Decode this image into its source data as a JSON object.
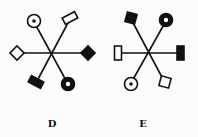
{
  "diagrams": [
    {
      "label": "D",
      "center": [
        52,
        53
      ],
      "arms": [
        {
          "direction": "upper-left",
          "end": [
            34,
            22
          ],
          "symbol": "circle-with-dot"
        },
        {
          "direction": "upper-right",
          "end": [
            69,
            21
          ],
          "symbol": "open-rectangle"
        },
        {
          "direction": "left",
          "end": [
            17,
            53
          ],
          "symbol": "open-diamond"
        },
        {
          "direction": "right",
          "end": [
            88,
            53
          ],
          "symbol": "filled-diamond"
        },
        {
          "direction": "lower-left",
          "end": [
            37,
            81
          ],
          "symbol": "filled-rectangle"
        },
        {
          "direction": "lower-right",
          "end": [
            68,
            84
          ],
          "symbol": "thick-ring"
        }
      ]
    },
    {
      "label": "E",
      "center": [
        148,
        52
      ],
      "arms": [
        {
          "direction": "upper-left",
          "end": [
            131,
            19
          ],
          "symbol": "filled-square"
        },
        {
          "direction": "upper-right",
          "end": [
            166,
            21
          ],
          "symbol": "thick-ring"
        },
        {
          "direction": "left",
          "end": [
            118,
            53
          ],
          "symbol": "open-rectangle-vertical"
        },
        {
          "direction": "right",
          "end": [
            180,
            53
          ],
          "symbol": "filled-rectangle-vertical"
        },
        {
          "direction": "lower-left",
          "end": [
            131,
            83
          ],
          "symbol": "circle-with-dot"
        },
        {
          "direction": "lower-right",
          "end": [
            164,
            81
          ],
          "symbol": "open-square"
        }
      ]
    }
  ],
  "colors": {
    "ink": "#111111",
    "paper": "#fcfcfa"
  }
}
